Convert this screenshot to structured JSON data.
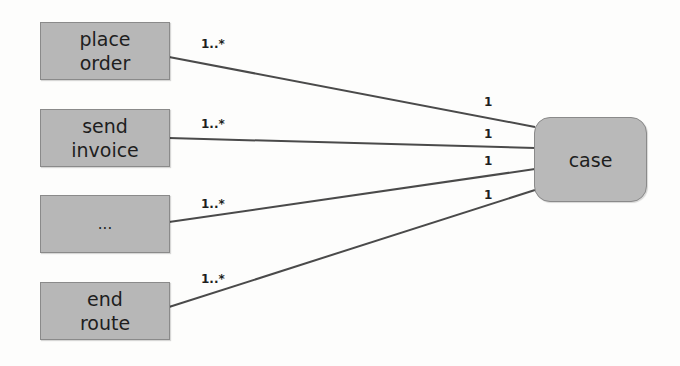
{
  "diagram": {
    "type": "uml-class-association",
    "colors": {
      "node_fill": "#b7b7b7",
      "node_border": "#8a8a8a",
      "edge": "#4a4a4a",
      "text": "#1e1e1e"
    },
    "target": {
      "id": "case",
      "label": "case"
    },
    "sources": [
      {
        "id": "place-order",
        "label": "place\norder",
        "source_multiplicity": "1..*",
        "target_multiplicity": "1"
      },
      {
        "id": "send-invoice",
        "label": "send\ninvoice",
        "source_multiplicity": "1..*",
        "target_multiplicity": "1"
      },
      {
        "id": "ellipsis",
        "label": "...",
        "source_multiplicity": "1..*",
        "target_multiplicity": "1"
      },
      {
        "id": "end-route",
        "label": "end\nroute",
        "source_multiplicity": "1..*",
        "target_multiplicity": "1"
      }
    ]
  }
}
